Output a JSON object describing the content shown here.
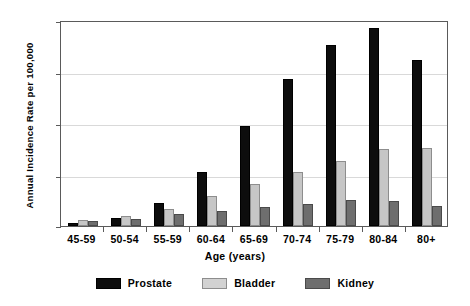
{
  "chart_data": {
    "type": "bar",
    "title": "",
    "xlabel": "Age (years)",
    "ylabel": "Annual Incidence Rate per 100,000",
    "categories": [
      "45-59",
      "50-54",
      "55-59",
      "60-64",
      "65-69",
      "70-74",
      "75-79",
      "80-84",
      "80+"
    ],
    "series": [
      {
        "name": "Prostate",
        "color": "#0d0d0d",
        "values": [
          5,
          15,
          45,
          104,
          194,
          285,
          352,
          384,
          323
        ]
      },
      {
        "name": "Bladder",
        "color": "#c6c6c6",
        "values": [
          12,
          20,
          33,
          59,
          82,
          105,
          126,
          149,
          151
        ]
      },
      {
        "name": "Kidney",
        "color": "#6e6e6e",
        "values": [
          10,
          14,
          23,
          30,
          36,
          42,
          50,
          48,
          38
        ]
      }
    ],
    "ylim": [
      0,
      400
    ],
    "yticks": [
      0,
      100,
      200,
      300,
      400
    ],
    "grid": true,
    "legend_position": "bottom"
  }
}
